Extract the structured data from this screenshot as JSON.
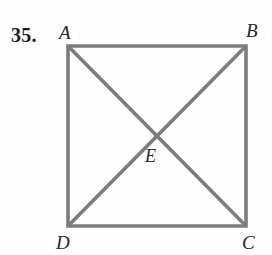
{
  "figure": {
    "problem_number": "35.",
    "shape_name": "square-with-diagonals",
    "stroke_color": "#7c7c7c",
    "stroke_width": 3.6,
    "background_color": "#fefefe",
    "label_color": "#262626",
    "square": {
      "corners": [
        {
          "id": "A",
          "label": "A",
          "x": 68,
          "y": 46
        },
        {
          "id": "B",
          "label": "B",
          "x": 246,
          "y": 46
        },
        {
          "id": "C",
          "label": "C",
          "x": 246,
          "y": 226
        },
        {
          "id": "D",
          "label": "D",
          "x": 68,
          "y": 226
        }
      ]
    },
    "diagonals": [
      {
        "id": "AC",
        "from": "A",
        "to": "C"
      },
      {
        "id": "BD",
        "from": "B",
        "to": "D"
      }
    ],
    "intersection": {
      "id": "E",
      "label": "E",
      "x": 157,
      "y": 136
    }
  }
}
